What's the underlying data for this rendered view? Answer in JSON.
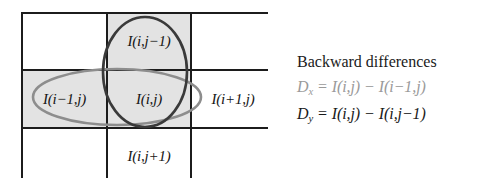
{
  "figure": {
    "name": "pixel-neighborhood-grid",
    "grid": {
      "rows": 3,
      "columns": 3,
      "cells": [
        {
          "id": "top-left",
          "label": "",
          "shaded": false
        },
        {
          "id": "top-center",
          "label": "I(i,j−1)",
          "shaded": true
        },
        {
          "id": "top-right",
          "label": "",
          "shaded": false
        },
        {
          "id": "middle-left",
          "label": "I(i−1,j)",
          "shaded": true
        },
        {
          "id": "middle-center",
          "label": "I(i,j)",
          "shaded": true
        },
        {
          "id": "middle-right",
          "label": "I(i+1,j)",
          "shaded": false
        },
        {
          "id": "bottom-left",
          "label": "",
          "shaded": false
        },
        {
          "id": "bottom-center",
          "label": "I(i,j+1)",
          "shaded": false
        },
        {
          "id": "bottom-right",
          "label": "",
          "shaded": false
        }
      ]
    },
    "annotations": {
      "vertical_ellipse": {
        "name": "vertical-ellipse-dy",
        "covers": [
          "top-center",
          "middle-center"
        ],
        "color": "#3a3a3a"
      },
      "horizontal_ellipse": {
        "name": "horizontal-ellipse-dx",
        "covers": [
          "middle-left",
          "middle-center"
        ],
        "color": "#8d8d8d"
      }
    },
    "colors": {
      "cell_shaded": "#e3e3e3",
      "cell_plain": "#ffffff",
      "grid_line": "#1c1c1c"
    }
  },
  "caption": {
    "title": "Backward differences",
    "equations": [
      {
        "id": "dx",
        "symbol": "D",
        "subscript": "x",
        "equals": "=",
        "left_term": "I(i,j)",
        "operator": "−",
        "right_term": "I(i−1,j)",
        "full_text": "Dx = I(i,j) − I(i−1,j)",
        "emphasis": "dim"
      },
      {
        "id": "dy",
        "symbol": "D",
        "subscript": "y",
        "equals": "=",
        "left_term": "I(i,j)",
        "operator": "−",
        "right_term": "I(i,j−1)",
        "full_text": "Dy = I(i,j) − I(i,j−1)",
        "emphasis": "strong"
      }
    ]
  }
}
